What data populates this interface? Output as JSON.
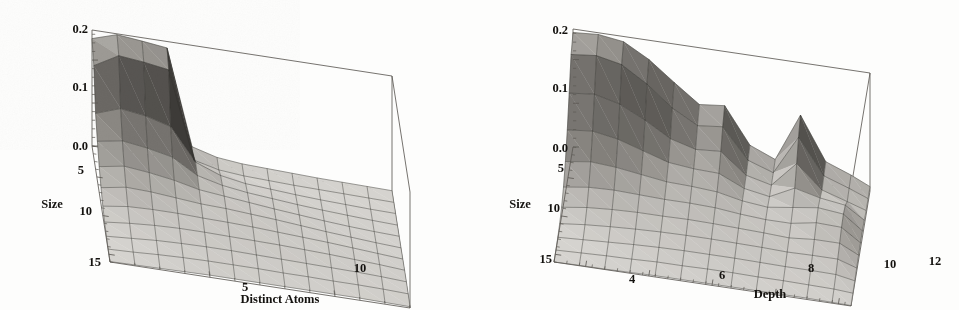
{
  "figure": {
    "background_color": "#fdfdfc",
    "ink_color": "#14120f",
    "axis_color": "#5d5a55",
    "mesh_color": "#2e2c29",
    "surface_light": "#d8d6d2",
    "surface_mid": "#8e8b86",
    "surface_dark": "#3a3835"
  },
  "chart_data": [
    {
      "id": "left",
      "type": "surface",
      "title": "",
      "xlabel": "Distinct Atoms",
      "ylabel": "Size",
      "zlabel": "",
      "xlim": [
        1,
        13
      ],
      "ylim": [
        1,
        16
      ],
      "zlim": [
        0.0,
        0.27
      ],
      "x_ticks": [
        5,
        10
      ],
      "x_tick_labels": [
        "5",
        "10"
      ],
      "x_minor_count": 4,
      "y_ticks": [
        5,
        10,
        15
      ],
      "y_tick_labels": [
        "5",
        "10",
        "15"
      ],
      "y_minor_count": 4,
      "z_ticks": [
        0.0,
        0.1,
        0.2
      ],
      "z_tick_labels": [
        "0.0",
        "0.1",
        "0.2"
      ],
      "z_minor_count": 4,
      "grid": false,
      "legend": "none",
      "x": [
        1,
        2,
        3,
        4,
        5,
        6,
        7,
        8,
        9,
        10,
        11,
        12,
        13
      ],
      "y": [
        1,
        2.5,
        4,
        5.5,
        7,
        8.5,
        10,
        11.5,
        13,
        14.5,
        16
      ],
      "z": [
        [
          0.25,
          0.268,
          0.262,
          0.255,
          0.034,
          0.018,
          0.012,
          0.01,
          0.008,
          0.006,
          0.005,
          0.004,
          0.003
        ],
        [
          0.214,
          0.246,
          0.24,
          0.231,
          0.03,
          0.016,
          0.011,
          0.009,
          0.007,
          0.006,
          0.005,
          0.004,
          0.003
        ],
        [
          0.13,
          0.15,
          0.142,
          0.126,
          0.052,
          0.03,
          0.02,
          0.016,
          0.012,
          0.009,
          0.007,
          0.005,
          0.004
        ],
        [
          0.092,
          0.102,
          0.094,
          0.082,
          0.048,
          0.034,
          0.026,
          0.021,
          0.016,
          0.012,
          0.009,
          0.006,
          0.004
        ],
        [
          0.06,
          0.07,
          0.064,
          0.055,
          0.042,
          0.036,
          0.03,
          0.024,
          0.019,
          0.014,
          0.01,
          0.007,
          0.005
        ],
        [
          0.038,
          0.048,
          0.046,
          0.041,
          0.036,
          0.034,
          0.03,
          0.026,
          0.021,
          0.016,
          0.012,
          0.008,
          0.005
        ],
        [
          0.022,
          0.03,
          0.032,
          0.032,
          0.03,
          0.029,
          0.027,
          0.024,
          0.021,
          0.018,
          0.014,
          0.01,
          0.006
        ],
        [
          0.012,
          0.018,
          0.022,
          0.024,
          0.024,
          0.023,
          0.022,
          0.021,
          0.019,
          0.017,
          0.014,
          0.011,
          0.007
        ],
        [
          0.006,
          0.01,
          0.014,
          0.016,
          0.017,
          0.017,
          0.016,
          0.015,
          0.014,
          0.013,
          0.012,
          0.01,
          0.007
        ],
        [
          0.003,
          0.005,
          0.008,
          0.01,
          0.011,
          0.011,
          0.011,
          0.01,
          0.01,
          0.009,
          0.009,
          0.008,
          0.006
        ],
        [
          0.001,
          0.002,
          0.003,
          0.004,
          0.005,
          0.005,
          0.005,
          0.005,
          0.005,
          0.005,
          0.005,
          0.004,
          0.003
        ]
      ]
    },
    {
      "id": "right",
      "type": "surface",
      "title": "",
      "xlabel": "Depth",
      "ylabel": "Size",
      "zlabel": "",
      "xlim": [
        3,
        12.4
      ],
      "ylim": [
        1,
        16
      ],
      "zlim": [
        0.0,
        0.27
      ],
      "x_ticks": [
        4,
        6,
        8,
        10,
        12
      ],
      "x_tick_labels": [
        "4",
        "6",
        "8",
        "10",
        "12"
      ],
      "x_minor_count": 4,
      "y_ticks": [
        5,
        10,
        15
      ],
      "y_tick_labels": [
        "5",
        "10",
        "15"
      ],
      "y_minor_count": 4,
      "z_ticks": [
        0.0,
        0.1,
        0.2
      ],
      "z_tick_labels": [
        "0.0",
        "0.1",
        "0.2"
      ],
      "z_minor_count": 4,
      "grid": false,
      "legend": "none",
      "x": [
        3,
        3.8,
        4.6,
        5.4,
        6.2,
        7.0,
        7.8,
        8.6,
        9.4,
        10.2,
        11.0,
        11.8,
        12.4
      ],
      "y": [
        1,
        2.5,
        4,
        5.5,
        7,
        8.5,
        10,
        11.5,
        13,
        14.5,
        16
      ],
      "z": [
        [
          0.262,
          0.266,
          0.258,
          0.226,
          0.182,
          0.14,
          0.146,
          0.064,
          0.04,
          0.15,
          0.052,
          0.03,
          0.01
        ],
        [
          0.238,
          0.244,
          0.232,
          0.196,
          0.15,
          0.118,
          0.124,
          0.056,
          0.036,
          0.126,
          0.046,
          0.026,
          0.009
        ],
        [
          0.176,
          0.182,
          0.168,
          0.14,
          0.106,
          0.09,
          0.094,
          0.048,
          0.034,
          0.092,
          0.04,
          0.022,
          0.008
        ],
        [
          0.118,
          0.124,
          0.114,
          0.096,
          0.078,
          0.072,
          0.07,
          0.044,
          0.034,
          0.062,
          0.048,
          0.04,
          0.012
        ],
        [
          0.072,
          0.08,
          0.076,
          0.068,
          0.06,
          0.058,
          0.054,
          0.042,
          0.036,
          0.044,
          0.052,
          0.046,
          0.014
        ],
        [
          0.04,
          0.048,
          0.05,
          0.048,
          0.046,
          0.046,
          0.044,
          0.038,
          0.034,
          0.034,
          0.044,
          0.042,
          0.013
        ],
        [
          0.02,
          0.028,
          0.032,
          0.034,
          0.034,
          0.035,
          0.034,
          0.032,
          0.03,
          0.027,
          0.032,
          0.032,
          0.011
        ],
        [
          0.009,
          0.015,
          0.019,
          0.022,
          0.024,
          0.025,
          0.025,
          0.024,
          0.023,
          0.021,
          0.022,
          0.022,
          0.008
        ],
        [
          0.004,
          0.007,
          0.01,
          0.013,
          0.015,
          0.016,
          0.016,
          0.016,
          0.015,
          0.014,
          0.014,
          0.013,
          0.005
        ],
        [
          0.001,
          0.003,
          0.005,
          0.006,
          0.008,
          0.008,
          0.009,
          0.009,
          0.008,
          0.008,
          0.007,
          0.006,
          0.003
        ],
        [
          0.0,
          0.001,
          0.001,
          0.002,
          0.003,
          0.003,
          0.003,
          0.003,
          0.003,
          0.003,
          0.003,
          0.002,
          0.001
        ]
      ]
    }
  ]
}
